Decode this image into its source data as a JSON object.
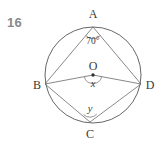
{
  "question": {
    "number": "16"
  },
  "figure": {
    "name": "circle-geometry-diagram",
    "stroke_color": "#555555",
    "label_color": "#3a3a3a",
    "number_color": "#8a8a8a",
    "center_label": "O",
    "vertices": [
      {
        "id": "A",
        "label": "A",
        "position": "top"
      },
      {
        "id": "B",
        "label": "B",
        "position": "left"
      },
      {
        "id": "C",
        "label": "C",
        "position": "bottom"
      },
      {
        "id": "D",
        "label": "D",
        "position": "right"
      }
    ],
    "angles": [
      {
        "id": "angle-at-a",
        "label": "70°",
        "at_vertex": "A",
        "value": 70
      },
      {
        "id": "angle-at-o",
        "label": "x",
        "at_vertex": "O",
        "value": null
      },
      {
        "id": "angle-at-c",
        "label": "y",
        "at_vertex": "C",
        "value": null
      }
    ],
    "segments": [
      {
        "id": "chord-ab",
        "from": "A",
        "to": "B"
      },
      {
        "id": "chord-ad",
        "from": "A",
        "to": "D"
      },
      {
        "id": "radius-ob",
        "from": "O",
        "to": "B"
      },
      {
        "id": "radius-od",
        "from": "O",
        "to": "D"
      },
      {
        "id": "chord-bc",
        "from": "B",
        "to": "C"
      },
      {
        "id": "chord-cd",
        "from": "C",
        "to": "D"
      }
    ]
  }
}
